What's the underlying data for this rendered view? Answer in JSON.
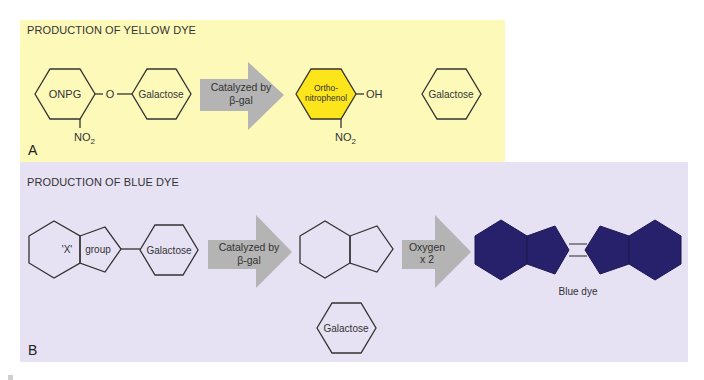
{
  "panel_a": {
    "title": "PRODUCTION OF YELLOW DYE",
    "letter": "A",
    "background": "#fdf9b9",
    "substrate": {
      "ring_label": "ONPG",
      "linker": "O",
      "sugar": "Galactose",
      "substituent": "NO",
      "substituent_sub": "2"
    },
    "arrow": {
      "line1": "Catalyzed by",
      "line2": "β-gal",
      "color": "#b4b4b4"
    },
    "product": {
      "line1": "Ortho-",
      "line2": "nitrophenol",
      "fill": "#fce51a",
      "group": "OH",
      "substituent": "NO",
      "substituent_sub": "2"
    },
    "released_sugar": "Galactose"
  },
  "panel_b": {
    "title": "PRODUCTION OF BLUE DYE",
    "letter": "B",
    "background": "#e6e1f3",
    "substrate": {
      "label1": "'X'",
      "label2": "group",
      "sugar": "Galactose"
    },
    "arrow1": {
      "line1": "Catalyzed by",
      "line2": "β-gal"
    },
    "released_sugar": "Galactose",
    "arrow2": {
      "line1": "Oxygen",
      "line2": "x 2"
    },
    "product": {
      "label": "Blue dye",
      "fill": "#27206b"
    }
  }
}
